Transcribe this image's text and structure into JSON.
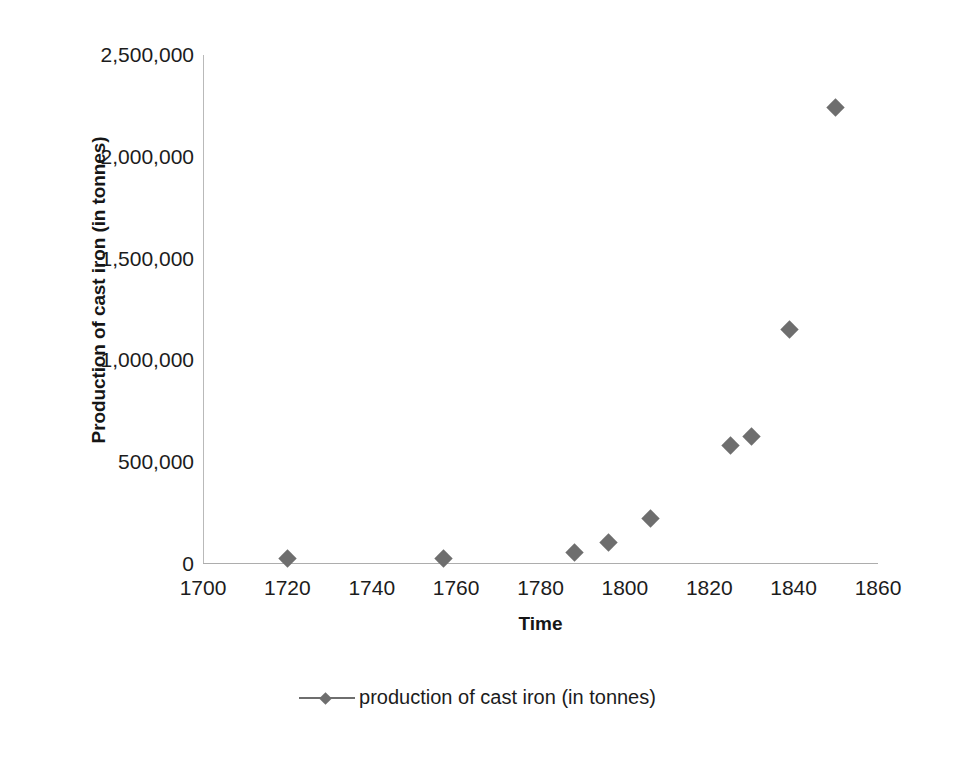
{
  "chart_data": {
    "type": "scatter",
    "title": "",
    "xlabel": "Time",
    "ylabel": "Production of cast iron (in tonnes)",
    "xlim": [
      1700,
      1860
    ],
    "ylim": [
      0,
      2500000
    ],
    "grid": false,
    "legend_position": "bottom-center",
    "series": [
      {
        "name": "production of cast iron (in tonnes)",
        "marker": "diamond",
        "color": "#6e6e6e",
        "points": [
          {
            "x": 1720,
            "y": 25000
          },
          {
            "x": 1757,
            "y": 28000
          },
          {
            "x": 1788,
            "y": 55000
          },
          {
            "x": 1796,
            "y": 105000
          },
          {
            "x": 1806,
            "y": 225000
          },
          {
            "x": 1825,
            "y": 580000
          },
          {
            "x": 1830,
            "y": 625000
          },
          {
            "x": 1839,
            "y": 1150000
          },
          {
            "x": 1850,
            "y": 2240000
          }
        ]
      }
    ],
    "x_ticks": [
      {
        "value": 1700,
        "label": "1700"
      },
      {
        "value": 1720,
        "label": "1720"
      },
      {
        "value": 1740,
        "label": "1740"
      },
      {
        "value": 1760,
        "label": "1760"
      },
      {
        "value": 1780,
        "label": "1780"
      },
      {
        "value": 1800,
        "label": "1800"
      },
      {
        "value": 1820,
        "label": "1820"
      },
      {
        "value": 1840,
        "label": "1840"
      },
      {
        "value": 1860,
        "label": "1860"
      }
    ],
    "y_ticks": [
      {
        "value": 0,
        "label": "0"
      },
      {
        "value": 500000,
        "label": "500,000"
      },
      {
        "value": 1000000,
        "label": "1,000,000"
      },
      {
        "value": 1500000,
        "label": "1,500,000"
      },
      {
        "value": 2000000,
        "label": "2,000,000"
      },
      {
        "value": 2500000,
        "label": "2,500,000"
      }
    ],
    "legend": [
      {
        "label": "production of cast iron (in tonnes)",
        "color": "#6e6e6e",
        "marker": "diamond"
      }
    ],
    "colors": {
      "marker": "#6e6e6e",
      "axis_line": "#b0b0b0",
      "text": "#1c1c1c",
      "background": "#ffffff"
    }
  }
}
